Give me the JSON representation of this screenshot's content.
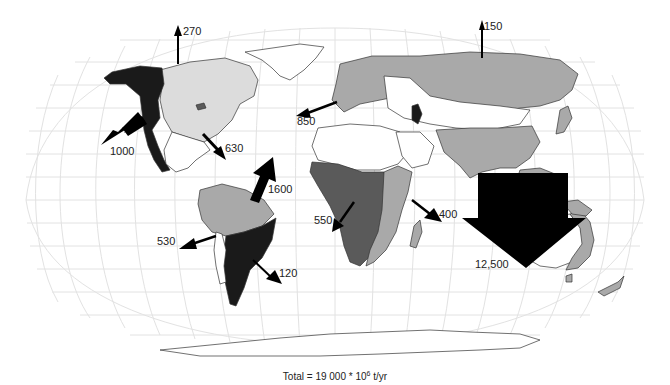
{
  "figure": {
    "caption_prefix": "Total = 19 000 * 10",
    "caption_exponent": "6",
    "caption_unit": " t/yr"
  },
  "colors": {
    "graticule": "#e2e2e2",
    "land_light": "#dcdcdc",
    "land_medium": "#a9a9a9",
    "land_dark": "#5a5a5a",
    "land_black": "#1a1a1a",
    "land_white": "#ffffff",
    "outline": "#333333",
    "arrow": "#000000"
  },
  "fluxes": [
    {
      "id": "arctic-north-america",
      "label": "270",
      "x": 183,
      "y": 26
    },
    {
      "id": "arctic-asia",
      "label": "150",
      "x": 484,
      "y": 21
    },
    {
      "id": "north-america-pacific",
      "label": "1000",
      "x": 110,
      "y": 147
    },
    {
      "id": "north-america-atlantic",
      "label": "630",
      "x": 225,
      "y": 143
    },
    {
      "id": "europe-atlantic",
      "label": "850",
      "x": 297,
      "y": 116
    },
    {
      "id": "south-america-atlantic",
      "label": "1600",
      "x": 268,
      "y": 184
    },
    {
      "id": "south-america-pacific",
      "label": "530",
      "x": 157,
      "y": 236
    },
    {
      "id": "south-america-south-atlantic",
      "label": "120",
      "x": 279,
      "y": 268
    },
    {
      "id": "africa-atlantic",
      "label": "550",
      "x": 314,
      "y": 215
    },
    {
      "id": "africa-indian",
      "label": "400",
      "x": 439,
      "y": 209
    },
    {
      "id": "asia-oceania",
      "label": "12,500",
      "x": 475,
      "y": 259
    }
  ]
}
